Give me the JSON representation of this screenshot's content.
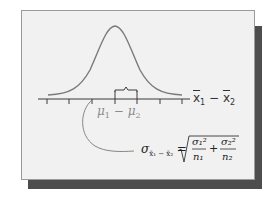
{
  "diagram": {
    "axis_variable": "x̄₁ − x̄₂",
    "axis_variable_parts": {
      "a": "x",
      "a_sub": "1",
      "op": "−",
      "b": "x",
      "b_sub": "2"
    },
    "center_label": "μ₁ − μ₂",
    "center_label_parts": {
      "a": "μ",
      "a_sub": "1",
      "op": "−",
      "b": "μ",
      "b_sub": "2"
    },
    "formula": "σ_{x̄₁ − x̄₂} = √(σ₁²/n₁ + σ₂²/n₂)",
    "formula_parts": {
      "lhs": "σ",
      "lhs_sub": "x̄₁ − x̄₂",
      "eq": "=",
      "term1_num": "σ₁²",
      "term1_den": "n₁",
      "plus": "+",
      "term2_num": "σ₂²",
      "term2_den": "n₂"
    },
    "tick_count": 7,
    "curve": "normal (bell) curve",
    "bracket": "one standard deviation from the mean"
  },
  "colors": {
    "card_background": "#f1f1f1",
    "card_border": "#9a9a9a",
    "shadow": "#4d4d4d",
    "curve": "#6e6e6e",
    "axis": "#3a3a3a",
    "muted_label": "#8a8a8a",
    "text": "#222222"
  }
}
